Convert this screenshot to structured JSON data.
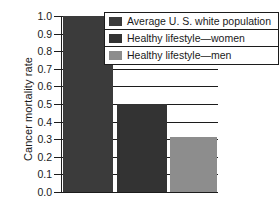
{
  "chart_data": {
    "type": "bar",
    "title": "",
    "xlabel": "",
    "ylabel": "Cancer mortality rate",
    "ylim": [
      0.0,
      1.0
    ],
    "ytick_labels": [
      "1.0",
      "0.9",
      "0.8",
      "0.7",
      "0.6",
      "0.5",
      "0.4",
      "0.3",
      "0.2",
      "0.1",
      "0.0"
    ],
    "ytick_values": [
      1.0,
      0.9,
      0.8,
      0.7,
      0.6,
      0.5,
      0.4,
      0.3,
      0.2,
      0.1,
      0.0
    ],
    "grid": true,
    "legend_position": "top-right-inside",
    "categories": [
      "Average U. S. white population",
      "Healthy lifestyle—women",
      "Healthy lifestyle—men"
    ],
    "values": [
      1.0,
      0.5,
      0.31
    ],
    "bar_colors": [
      "#3b3b3b",
      "#333333",
      "#8d8d8d"
    ],
    "series": [
      {
        "name": "Cancer mortality rate",
        "values": [
          1.0,
          0.5,
          0.31
        ]
      }
    ]
  },
  "axis": {
    "y_title": "Cancer mortality rate"
  },
  "legend": {
    "entries": [
      {
        "label": "Average U. S. white population",
        "color": "#3b3b3b"
      },
      {
        "label": "Healthy lifestyle—women",
        "color": "#333333"
      },
      {
        "label": "Healthy lifestyle—men",
        "color": "#8d8d8d"
      }
    ]
  }
}
